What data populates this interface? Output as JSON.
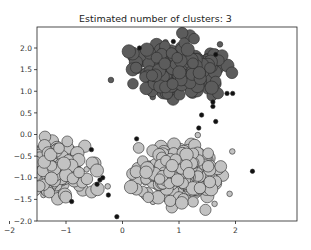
{
  "chart_data": {
    "type": "scatter",
    "title": "Estimated number of clusters: 3",
    "xlabel": "",
    "ylabel": "",
    "xlim": [
      -2.5,
      2.1
    ],
    "ylim": [
      -2.0,
      2.4
    ],
    "xticks": [
      -2,
      -1,
      0,
      1,
      2
    ],
    "yticks": [
      -2.0,
      -1.5,
      -1.0,
      -0.5,
      0.0,
      0.5,
      1.0,
      1.5,
      2.0
    ],
    "ytick_labels": [
      "−2.0",
      "−1.5",
      "−1.0",
      "−0.5",
      "0.0",
      "0.5",
      "1.0",
      "1.5",
      "2.0"
    ],
    "xtick_labels": [
      "−2",
      "−1",
      "0",
      "1",
      "2"
    ],
    "grid": false,
    "legend": null,
    "series": [
      {
        "name": "cluster 0",
        "color": "#5c5c5c",
        "center": [
          1.0,
          1.5
        ],
        "spread": [
          0.45,
          0.35
        ],
        "n_core": 260,
        "marker_size": "large"
      },
      {
        "name": "cluster 1",
        "color": "#c2c2c2",
        "center": [
          -1.35,
          -0.85
        ],
        "spread": [
          0.45,
          0.38
        ],
        "n_core": 260,
        "marker_size": "large"
      },
      {
        "name": "cluster 2",
        "color": "#c2c2c2",
        "center": [
          1.0,
          -0.9
        ],
        "spread": [
          0.45,
          0.38
        ],
        "n_core": 240,
        "marker_size": "large"
      },
      {
        "name": "noise",
        "color": "#111111",
        "marker_size": "small",
        "points": [
          [
            0.3,
            2.0
          ],
          [
            0.9,
            2.15
          ],
          [
            1.65,
            1.85
          ],
          [
            1.85,
            0.95
          ],
          [
            1.6,
            0.75
          ],
          [
            1.6,
            0.65
          ],
          [
            1.4,
            0.45
          ],
          [
            1.95,
            0.95
          ],
          [
            1.65,
            0.3
          ],
          [
            0.25,
            -0.1
          ],
          [
            -2.2,
            -0.6
          ],
          [
            -0.55,
            -0.35
          ],
          [
            -0.35,
            -1.0
          ],
          [
            -0.4,
            -1.05
          ],
          [
            -0.45,
            -1.15
          ],
          [
            -0.25,
            -1.4
          ],
          [
            -1.7,
            -1.75
          ],
          [
            -1.6,
            -1.8
          ],
          [
            -0.9,
            -1.55
          ],
          [
            -0.1,
            -1.9
          ],
          [
            1.35,
            0.15
          ],
          [
            2.3,
            -0.85
          ]
        ]
      }
    ]
  }
}
